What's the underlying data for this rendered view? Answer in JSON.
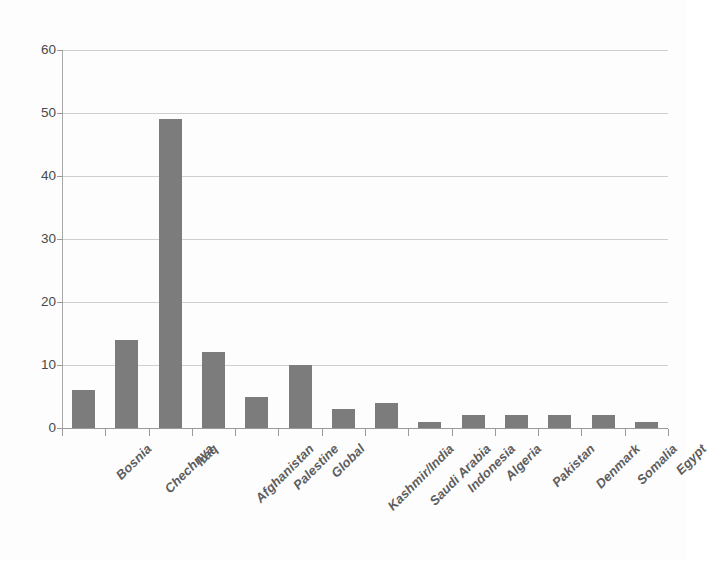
{
  "chart_data": {
    "type": "bar",
    "title": "",
    "subtitle": "",
    "xlabel": "",
    "ylabel": "",
    "ylim": [
      0,
      60
    ],
    "y_ticks": [
      "0",
      "10",
      "20",
      "30",
      "40",
      "50",
      "60"
    ],
    "grid": true,
    "legend": false,
    "legend_position": "none",
    "orientation": "vertical",
    "bar_color": "#7c7c7c",
    "gridline_color": "#cfcfcf",
    "axis_color": "#9a9a9a",
    "background_color": "#fdfdfd",
    "categories": [
      "Bosnia",
      "Chechnya",
      "Iraq",
      "Afghanistan",
      "Palestine",
      "Global",
      "Kashmir/India",
      "Saudi Arabia",
      "Indonesia",
      "Algeria",
      "Pakistan",
      "Denmark",
      "Somalia",
      "Egypt"
    ],
    "values": [
      6,
      14,
      49,
      12,
      5,
      10,
      3,
      4,
      1,
      2,
      2,
      2,
      2,
      1
    ]
  }
}
